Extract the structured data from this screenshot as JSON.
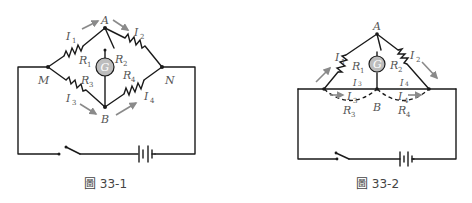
{
  "figures": [
    {
      "id": "fig-33-1",
      "caption": "圖 33-1",
      "nodes": {
        "A": "A",
        "B": "B",
        "M": "M",
        "N": "N"
      },
      "galvanometer": "G",
      "resistors": [
        {
          "name": "R",
          "sub": "1"
        },
        {
          "name": "R",
          "sub": "2"
        },
        {
          "name": "R",
          "sub": "3"
        },
        {
          "name": "R",
          "sub": "4"
        }
      ],
      "currents": [
        {
          "name": "I",
          "sub": "1"
        },
        {
          "name": "I",
          "sub": "2"
        },
        {
          "name": "I",
          "sub": "3"
        },
        {
          "name": "I",
          "sub": "4"
        }
      ]
    },
    {
      "id": "fig-33-2",
      "caption": "圖 33-2",
      "nodes": {
        "A": "A",
        "B": "B"
      },
      "galvanometer": "G",
      "resistors": [
        {
          "name": "R",
          "sub": "1"
        },
        {
          "name": "R",
          "sub": "2"
        },
        {
          "name": "R",
          "sub": "3"
        },
        {
          "name": "R",
          "sub": "4"
        }
      ],
      "currents": [
        {
          "name": "I",
          "sub": "1"
        },
        {
          "name": "I",
          "sub": "2"
        },
        {
          "name": "I",
          "sub": "3"
        },
        {
          "name": "I",
          "sub": "4"
        }
      ],
      "wire_labels": [
        {
          "name": "I",
          "sub": "3"
        },
        {
          "name": "I",
          "sub": "4"
        }
      ]
    }
  ],
  "colors": {
    "wire": "#1a1a1a",
    "arrow": "#8a8a8a",
    "galvanometer_fill": "#bdbdbd",
    "label": "#555555"
  }
}
